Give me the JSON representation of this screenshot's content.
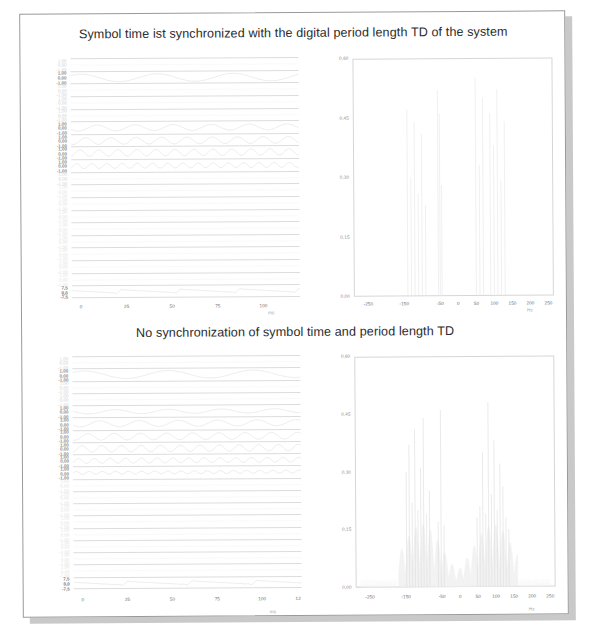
{
  "document": {
    "kind": "scanned-page",
    "background": "#ffffff",
    "shadow_color": "#c9c9c9",
    "border_color": "#9a9a9a"
  },
  "figures": [
    {
      "id": "top",
      "title": "Symbol time ist synchronized with the digital period length TD of the system",
      "time_plot": {
        "xlabel": "ms",
        "xticks": [
          "0",
          "25",
          "50",
          "75",
          "100"
        ],
        "xtick_values": [
          0,
          25,
          50,
          75,
          100
        ],
        "xlim": [
          -5,
          120
        ],
        "channel_ytick_labels": [
          "1,00",
          "0,00",
          "-1,00"
        ],
        "last_channel_ytick_labels": [
          "7,5",
          "0,0",
          "-7,5"
        ],
        "n_channels": 19
      },
      "spectrum_plot": {
        "xlabel": "Hz",
        "yticks": [
          "0,60",
          "0,45",
          "0,30",
          "0,15",
          "0,00"
        ],
        "ytick_values": [
          0.6,
          0.45,
          0.3,
          0.15,
          0.0
        ],
        "ylim": [
          0,
          0.6
        ],
        "xticks": [
          "-250",
          "-150",
          "-50",
          "0",
          "50",
          "100",
          "150",
          "200",
          "250"
        ],
        "xtick_values": [
          -250,
          -150,
          -50,
          0,
          50,
          100,
          150,
          200,
          250
        ],
        "xlim": [
          -290,
          265
        ]
      }
    },
    {
      "id": "bottom",
      "title": "No synchronization of symbol time and period length TD",
      "time_plot": {
        "xlabel": "ms",
        "xticks": [
          "0",
          "25",
          "50",
          "75",
          "100",
          "12"
        ],
        "xtick_values": [
          0,
          25,
          50,
          75,
          100,
          120
        ],
        "xlim": [
          -5,
          122
        ],
        "channel_ytick_labels": [
          "1,00",
          "0,00",
          "-1,00"
        ],
        "last_channel_ytick_labels": [
          "7,5",
          "0,0",
          "-7,5"
        ],
        "n_channels": 19
      },
      "spectrum_plot": {
        "xlabel": "Hz",
        "yticks": [
          "0,60",
          "0,45",
          "0,30",
          "0,15",
          "0,00"
        ],
        "ytick_values": [
          0.6,
          0.45,
          0.3,
          0.15,
          0.0
        ],
        "ylim": [
          0,
          0.6
        ],
        "xticks": [
          "-250",
          "-150",
          "-50",
          "0",
          "50",
          "100",
          "150",
          "200",
          "250"
        ],
        "xtick_values": [
          -250,
          -150,
          -50,
          0,
          50,
          100,
          150,
          200,
          250
        ],
        "xlim": [
          -290,
          265
        ]
      }
    }
  ],
  "chart_data": [
    {
      "id": "top-time",
      "type": "line",
      "title": "Symbol time ist synchronized with the digital period length TD of the system",
      "subtitle": "stacked sub-carrier time signals",
      "xlabel": "ms",
      "ylabel": "",
      "xlim": [
        -5,
        120
      ],
      "xticks": [
        0,
        25,
        50,
        75,
        100
      ],
      "grid": false,
      "legend": "none",
      "series": [
        {
          "name": "channel-1",
          "ylim": [
            -1,
            1
          ],
          "yticks": [
            "1,00",
            "0,00",
            "-1,00"
          ],
          "cycles": 0.0,
          "amp": 0.05
        },
        {
          "name": "channel-2",
          "ylim": [
            -1,
            1
          ],
          "yticks": [
            "1,00",
            "0,00",
            "-1,00"
          ],
          "cycles": 3.0,
          "amp": 0.72
        },
        {
          "name": "channel-3",
          "ylim": [
            -1,
            1
          ],
          "yticks": [
            "1,00",
            "0,00",
            "-1,00"
          ],
          "cycles": 0.0,
          "amp": 0.04
        },
        {
          "name": "channel-4",
          "ylim": [
            -1,
            1
          ],
          "yticks": [
            "1,00",
            "0,00",
            "-1,00"
          ],
          "cycles": 0.0,
          "amp": 0.03
        },
        {
          "name": "channel-5",
          "ylim": [
            -1,
            1
          ],
          "yticks": [
            "1,00",
            "0,00",
            "-1,00"
          ],
          "cycles": 0.0,
          "amp": 0.03
        },
        {
          "name": "channel-6",
          "ylim": [
            -1,
            1
          ],
          "yticks": [
            "1,00",
            "0,00",
            "-1,00"
          ],
          "cycles": 6.0,
          "amp": 0.55
        },
        {
          "name": "channel-7",
          "ylim": [
            -1,
            1
          ],
          "yticks": [
            "1,00",
            "0,00",
            "-1,00"
          ],
          "cycles": 9.0,
          "amp": 0.62
        },
        {
          "name": "channel-8",
          "ylim": [
            -1,
            1
          ],
          "yticks": [
            "1,00",
            "0,00",
            "-1,00"
          ],
          "cycles": 12.0,
          "amp": 0.6
        },
        {
          "name": "channel-9",
          "ylim": [
            -1,
            1
          ],
          "yticks": [
            "1,00",
            "0,00",
            "-1,00"
          ],
          "cycles": 15.0,
          "amp": 0.45
        },
        {
          "name": "channel-10",
          "ylim": [
            -1,
            1
          ],
          "yticks": [
            "1,00",
            "0,00",
            "-1,00"
          ],
          "cycles": 0.0,
          "amp": 0.03
        },
        {
          "name": "channel-11",
          "ylim": [
            -1,
            1
          ],
          "yticks": [
            "1,00",
            "0,00",
            "-1,00"
          ],
          "cycles": 0.0,
          "amp": 0.03
        },
        {
          "name": "channel-12",
          "ylim": [
            -1,
            1
          ],
          "yticks": [
            "1,00",
            "0,00",
            "-1,00"
          ],
          "cycles": 0.0,
          "amp": 0.02
        },
        {
          "name": "channel-13",
          "ylim": [
            -1,
            1
          ],
          "yticks": [
            "1,00",
            "0,00",
            "-1,00"
          ],
          "cycles": 0.0,
          "amp": 0.02
        },
        {
          "name": "channel-14",
          "ylim": [
            -1,
            1
          ],
          "yticks": [
            "1,00",
            "0,00",
            "-1,00"
          ],
          "cycles": 0.0,
          "amp": 0.02
        },
        {
          "name": "channel-15",
          "ylim": [
            -1,
            1
          ],
          "yticks": [
            "1,00",
            "0,00",
            "-1,00"
          ],
          "cycles": 0.0,
          "amp": 0.02
        },
        {
          "name": "channel-16",
          "ylim": [
            -1,
            1
          ],
          "yticks": [
            "1,00",
            "0,00",
            "-1,00"
          ],
          "cycles": 0.0,
          "amp": 0.02
        },
        {
          "name": "channel-17",
          "ylim": [
            -1,
            1
          ],
          "yticks": [
            "1,00",
            "0,00",
            "-1,00"
          ],
          "cycles": 0.0,
          "amp": 0.02
        },
        {
          "name": "channel-18",
          "ylim": [
            -1,
            1
          ],
          "yticks": [
            "1,00",
            "0,00",
            "-1,00"
          ],
          "cycles": 0.0,
          "amp": 0.02
        },
        {
          "name": "sum-signal",
          "ylim": [
            -7.5,
            7.5
          ],
          "yticks": [
            "7,5",
            "0,0",
            "-7,5"
          ],
          "cycles": 24.0,
          "amp": 0.3
        }
      ]
    },
    {
      "id": "top-spectrum",
      "type": "bar",
      "title": "Spectrum - synchronized (no leakage)",
      "xlabel": "Hz",
      "ylabel": "",
      "xlim": [
        -290,
        265
      ],
      "ylim": [
        0,
        0.6
      ],
      "xticks": [
        -250,
        -150,
        -50,
        0,
        50,
        100,
        150,
        200,
        250
      ],
      "yticks": [
        0.0,
        0.15,
        0.3,
        0.45,
        0.6
      ],
      "grid": false,
      "legend": "none",
      "leakage": false,
      "x": [
        -140,
        -130,
        -120,
        -110,
        -100,
        -90,
        -55,
        -50,
        -45,
        50,
        60,
        70,
        90,
        100,
        110,
        120,
        130
      ],
      "values": [
        0.47,
        0.3,
        0.44,
        0.26,
        0.41,
        0.23,
        0.52,
        0.46,
        0.28,
        0.55,
        0.33,
        0.5,
        0.46,
        0.38,
        0.52,
        0.29,
        0.44
      ]
    },
    {
      "id": "bottom-time",
      "type": "line",
      "title": "No synchronization of symbol time and period length TD",
      "subtitle": "stacked sub-carrier time signals",
      "xlabel": "ms",
      "ylabel": "",
      "xlim": [
        -5,
        122
      ],
      "xticks": [
        0,
        25,
        50,
        75,
        100,
        120
      ],
      "grid": false,
      "legend": "none",
      "series": [
        {
          "name": "channel-1",
          "ylim": [
            -1,
            1
          ],
          "yticks": [
            "1,00",
            "0,00",
            "-1,00"
          ],
          "cycles": 0.0,
          "amp": 0.05
        },
        {
          "name": "channel-2",
          "ylim": [
            -1,
            1
          ],
          "yticks": [
            "1,00",
            "0,00",
            "-1,00"
          ],
          "cycles": 2.7,
          "amp": 0.74
        },
        {
          "name": "channel-3",
          "ylim": [
            -1,
            1
          ],
          "yticks": [
            "1,00",
            "0,00",
            "-1,00"
          ],
          "cycles": 0.0,
          "amp": 0.04
        },
        {
          "name": "channel-4",
          "ylim": [
            -1,
            1
          ],
          "yticks": [
            "1,00",
            "0,00",
            "-1,00"
          ],
          "cycles": 0.0,
          "amp": 0.03
        },
        {
          "name": "channel-5",
          "ylim": [
            -1,
            1
          ],
          "yticks": [
            "1,00",
            "0,00",
            "-1,00"
          ],
          "cycles": 4.3,
          "amp": 0.4
        },
        {
          "name": "channel-6",
          "ylim": [
            -1,
            1
          ],
          "yticks": [
            "1,00",
            "0,00",
            "-1,00"
          ],
          "cycles": 5.8,
          "amp": 0.58
        },
        {
          "name": "channel-7",
          "ylim": [
            -1,
            1
          ],
          "yticks": [
            "1,00",
            "0,00",
            "-1,00"
          ],
          "cycles": 8.7,
          "amp": 0.64
        },
        {
          "name": "channel-8",
          "ylim": [
            -1,
            1
          ],
          "yticks": [
            "1,00",
            "0,00",
            "-1,00"
          ],
          "cycles": 11.6,
          "amp": 0.62
        },
        {
          "name": "channel-9",
          "ylim": [
            -1,
            1
          ],
          "yticks": [
            "1,00",
            "0,00",
            "-1,00"
          ],
          "cycles": 14.5,
          "amp": 0.48
        },
        {
          "name": "channel-10",
          "ylim": [
            -1,
            1
          ],
          "yticks": [
            "1,00",
            "0,00",
            "-1,00"
          ],
          "cycles": 17.4,
          "amp": 0.28
        },
        {
          "name": "channel-11",
          "ylim": [
            -1,
            1
          ],
          "yticks": [
            "1,00",
            "0,00",
            "-1,00"
          ],
          "cycles": 0.0,
          "amp": 0.03
        },
        {
          "name": "channel-12",
          "ylim": [
            -1,
            1
          ],
          "yticks": [
            "1,00",
            "0,00",
            "-1,00"
          ],
          "cycles": 0.0,
          "amp": 0.02
        },
        {
          "name": "channel-13",
          "ylim": [
            -1,
            1
          ],
          "yticks": [
            "1,00",
            "0,00",
            "-1,00"
          ],
          "cycles": 0.0,
          "amp": 0.02
        },
        {
          "name": "channel-14",
          "ylim": [
            -1,
            1
          ],
          "yticks": [
            "1,00",
            "0,00",
            "-1,00"
          ],
          "cycles": 0.0,
          "amp": 0.02
        },
        {
          "name": "channel-15",
          "ylim": [
            -1,
            1
          ],
          "yticks": [
            "1,00",
            "0,00",
            "-1,00"
          ],
          "cycles": 0.0,
          "amp": 0.02
        },
        {
          "name": "channel-16",
          "ylim": [
            -1,
            1
          ],
          "yticks": [
            "1,00",
            "0,00",
            "-1,00"
          ],
          "cycles": 0.0,
          "amp": 0.02
        },
        {
          "name": "channel-17",
          "ylim": [
            -1,
            1
          ],
          "yticks": [
            "1,00",
            "0,00",
            "-1,00"
          ],
          "cycles": 0.0,
          "amp": 0.02
        },
        {
          "name": "channel-18",
          "ylim": [
            -1,
            1
          ],
          "yticks": [
            "1,00",
            "0,00",
            "-1,00"
          ],
          "cycles": 0.0,
          "amp": 0.02
        },
        {
          "name": "sum-signal",
          "ylim": [
            -7.5,
            7.5
          ],
          "yticks": [
            "7,5",
            "0,0",
            "-7,5"
          ],
          "cycles": 22.0,
          "amp": 0.32
        }
      ]
    },
    {
      "id": "bottom-spectrum",
      "type": "bar",
      "title": "Spectrum - not synchronized (spectral leakage)",
      "xlabel": "Hz",
      "ylabel": "",
      "xlim": [
        -290,
        265
      ],
      "ylim": [
        0,
        0.6
      ],
      "xticks": [
        -250,
        -150,
        -50,
        0,
        50,
        100,
        150,
        200,
        250
      ],
      "yticks": [
        0.0,
        0.15,
        0.3,
        0.45,
        0.6
      ],
      "grid": false,
      "legend": "none",
      "leakage": true,
      "peaks_x": [
        -148,
        -140,
        -132,
        -124,
        -116,
        -108,
        -100,
        -92,
        -84,
        -60,
        -52,
        -44,
        48,
        56,
        64,
        72,
        80,
        88,
        96,
        104,
        112,
        120,
        128,
        136
      ],
      "peaks_y": [
        0.3,
        0.37,
        0.22,
        0.41,
        0.2,
        0.31,
        0.44,
        0.19,
        0.25,
        0.17,
        0.46,
        0.16,
        0.18,
        0.21,
        0.35,
        0.19,
        0.48,
        0.24,
        0.38,
        0.2,
        0.32,
        0.26,
        0.18,
        0.15
      ],
      "noise_floor_range": [
        -170,
        160
      ],
      "noise_floor_level": 0.035
    }
  ]
}
